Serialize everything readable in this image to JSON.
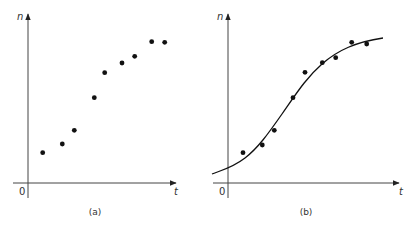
{
  "chart_data": [
    {
      "type": "scatter",
      "panel_label": "(a)",
      "xlabel": "t",
      "ylabel": "n",
      "origin_label": "0",
      "grid": false,
      "legend": null,
      "series": [
        {
          "name": "observations",
          "points": [
            {
              "x": 42.7,
              "y": 152.7
            },
            {
              "x": 62.3,
              "y": 144.0
            },
            {
              "x": 74.3,
              "y": 130.3
            },
            {
              "x": 94.3,
              "y": 97.7
            },
            {
              "x": 104.7,
              "y": 72.7
            },
            {
              "x": 122.0,
              "y": 63.0
            },
            {
              "x": 134.7,
              "y": 56.3
            },
            {
              "x": 151.7,
              "y": 41.7
            },
            {
              "x": 164.7,
              "y": 42.3
            }
          ]
        }
      ]
    },
    {
      "type": "scatter",
      "panel_label": "(b)",
      "xlabel": "t",
      "ylabel": "n",
      "origin_label": "0",
      "grid": false,
      "legend": null,
      "series": [
        {
          "name": "observations",
          "points": [
            {
              "x": 243.0,
              "y": 152.7
            },
            {
              "x": 262.3,
              "y": 145.0
            },
            {
              "x": 274.3,
              "y": 130.3
            },
            {
              "x": 293.0,
              "y": 97.7
            },
            {
              "x": 305.0,
              "y": 72.3
            },
            {
              "x": 322.3,
              "y": 62.7
            },
            {
              "x": 335.7,
              "y": 57.7
            },
            {
              "x": 351.7,
              "y": 42.3
            },
            {
              "x": 366.7,
              "y": 44.0
            }
          ]
        },
        {
          "name": "fitted logistic curve",
          "type": "line",
          "path": "M 212 174 C 222 170, 232 168, 245 158 C 258 148, 268 134, 282 114 C 296 94, 306 78, 322 64 C 338 50, 356 42, 383 38"
        }
      ]
    }
  ],
  "labels": {
    "a": {
      "panel": "(a)",
      "x": "t",
      "y": "n",
      "origin": "0"
    },
    "b": {
      "panel": "(b)",
      "x": "t",
      "y": "n",
      "origin": "0"
    }
  },
  "colors": {
    "ink": "#111111",
    "axis": "#444444",
    "text": "#333333"
  }
}
